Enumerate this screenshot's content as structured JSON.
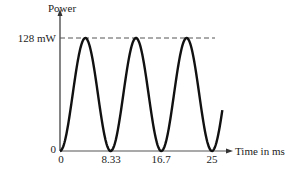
{
  "chart_data": {
    "type": "line",
    "title": "",
    "xlabel": "Time in ms",
    "ylabel": "Power",
    "x_ticks": [
      "0",
      "8.33",
      "16.7",
      "25"
    ],
    "x_tick_values": [
      0,
      8.33,
      16.7,
      25
    ],
    "y_ticks": [
      "0",
      "128 mW"
    ],
    "y_tick_values": [
      0,
      128
    ],
    "xlim": [
      0,
      26.7
    ],
    "ylim": [
      0,
      128
    ],
    "grid": false,
    "legend": null,
    "annotations": [
      "dashed reference line at 128 mW"
    ],
    "series": [
      {
        "name": "Power",
        "function": "P(t) = 128 * sin^2(pi * t / 8.33) mW",
        "x": [
          0,
          2.08,
          4.17,
          6.25,
          8.33,
          10.42,
          12.5,
          14.58,
          16.7,
          18.75,
          20.83,
          22.92,
          25,
          26.7
        ],
        "values": [
          0,
          64,
          128,
          64,
          0,
          64,
          128,
          64,
          0,
          64,
          128,
          64,
          0,
          46
        ]
      }
    ]
  },
  "labels": {
    "y_axis": "Power",
    "x_axis": "Time in ms",
    "y_max": "128 mW",
    "y_zero": "0",
    "x_ticks": [
      "0",
      "8.33",
      "16.7",
      "25"
    ]
  }
}
